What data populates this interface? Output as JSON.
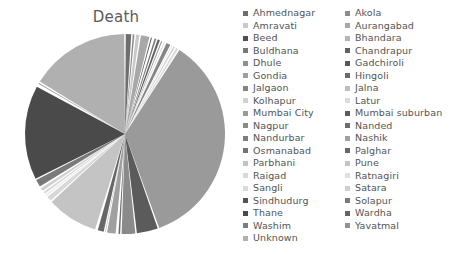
{
  "chart_data": {
    "type": "pie",
    "title": "Death",
    "xlabel": "",
    "ylabel": "",
    "legend_position": "right",
    "grid": false,
    "categories": [
      "Ahmednagar",
      "Akola",
      "Amravati",
      "Aurangabad",
      "Beed",
      "Bhandara",
      "Buldhana",
      "Chandrapur",
      "Dhule",
      "Gadchiroli",
      "Gondia",
      "Hingoli",
      "Jalgaon",
      "Jalna",
      "Kolhapur",
      "Latur",
      "Mumbai City",
      "Mumbai suburban",
      "Nagpur",
      "Nanded",
      "Nandurbar",
      "Nashik",
      "Osmanabad",
      "Palghar",
      "Parbhani",
      "Pune",
      "Raigad",
      "Ratnagiri",
      "Sangli",
      "Satara",
      "Sindhudurg",
      "Solapur",
      "Thane",
      "Wardha",
      "Washim",
      "Yavatmal",
      "Unknown"
    ],
    "values": [
      1.1,
      0.5,
      0.8,
      1.6,
      0.4,
      0.2,
      0.5,
      0.6,
      0.4,
      0.1,
      0.3,
      0.1,
      0.9,
      0.3,
      0.5,
      0.6,
      35.0,
      3.6,
      2.4,
      0.5,
      0.2,
      1.6,
      0.3,
      1.2,
      0.2,
      8.4,
      1.0,
      0.4,
      0.6,
      0.7,
      0.1,
      1.4,
      15.2,
      0.2,
      0.1,
      0.4,
      16.1
    ],
    "colors": [
      "#6e6e6e",
      "#8c8c8c",
      "#c9c9c9",
      "#a8a8a8",
      "#4f4f4f",
      "#b5b5b5",
      "#777777",
      "#616161",
      "#909090",
      "#585858",
      "#9e9e9e",
      "#6a6a6a",
      "#858585",
      "#bdbdbd",
      "#d2d2d2",
      "#dcdcdc",
      "#9a9a9a",
      "#5b5b5b",
      "#8a8a8a",
      "#6c6c6c",
      "#7e7e7e",
      "#a0a0a0",
      "#747474",
      "#676767",
      "#c2c2c2",
      "#c4c4c4",
      "#d8d8d8",
      "#e0e0e0",
      "#dadada",
      "#cfcfcf",
      "#525252",
      "#7a7a7a",
      "#4a4a4a",
      "#636363",
      "#7d7d7d",
      "#929292",
      "#b0b0b0"
    ]
  },
  "legend": {
    "column_1": [
      "Ahmednagar",
      "Amravati",
      "Beed",
      "Buldhana",
      "Dhule",
      "Gondia",
      "Jalgaon",
      "Kolhapur",
      "Mumbai City",
      "Nagpur",
      "Nandurbar",
      "Osmanabad",
      "Parbhani",
      "Raigad",
      "Sangli",
      "Sindhudurg",
      "Thane",
      "Washim",
      "Unknown"
    ],
    "column_1_colors": [
      "#6e6e6e",
      "#c9c9c9",
      "#4f4f4f",
      "#777777",
      "#909090",
      "#9e9e9e",
      "#858585",
      "#d2d2d2",
      "#9a9a9a",
      "#8a8a8a",
      "#7e7e7e",
      "#747474",
      "#c2c2c2",
      "#d8d8d8",
      "#dadada",
      "#525252",
      "#4a4a4a",
      "#7d7d7d",
      "#b0b0b0"
    ],
    "column_2": [
      "Akola",
      "Aurangabad",
      "Bhandara",
      "Chandrapur",
      "Gadchiroli",
      "Hingoli",
      "Jalna",
      "Latur",
      "Mumbai suburban",
      "Nanded",
      "Nashik",
      "Palghar",
      "Pune",
      "Ratnagiri",
      "Satara",
      "Solapur",
      "Wardha",
      "Yavatmal"
    ],
    "column_2_colors": [
      "#8c8c8c",
      "#a8a8a8",
      "#b5b5b5",
      "#616161",
      "#585858",
      "#6a6a6a",
      "#bdbdbd",
      "#dcdcdc",
      "#5b5b5b",
      "#6c6c6c",
      "#a0a0a0",
      "#676767",
      "#c4c4c4",
      "#e0e0e0",
      "#cfcfcf",
      "#7a7a7a",
      "#636363",
      "#929292"
    ]
  }
}
